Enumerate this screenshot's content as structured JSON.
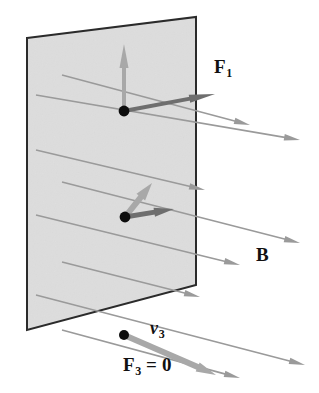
{
  "figure": {
    "type": "physics-vector-diagram",
    "width": 319,
    "height": 393,
    "background_color": "#ffffff"
  },
  "labels": {
    "force_1": {
      "symbol": "F",
      "subscript": "1",
      "text": "F1",
      "x": 214,
      "y": 57
    },
    "field": {
      "symbol": "B",
      "subscript": "",
      "text": "B",
      "x": 256,
      "y": 245
    },
    "velocity_3": {
      "symbol": "v",
      "subscript": "3",
      "text": "v3",
      "x": 150,
      "y": 319
    },
    "force_3": {
      "symbol": "F",
      "subscript": "3",
      "equals": " = 0",
      "text": "F3 = 0",
      "x": 123,
      "y": 355
    }
  },
  "colors": {
    "plane_fill": "#e3e3e3",
    "plane_edge": "#2b2b2b",
    "field_line": "#9a9a9a",
    "force_arrow": "#a8a8a8",
    "velocity_arrow": "#6e6e6e",
    "charge_dot": "#0d0d0d",
    "label_text": "#111111"
  },
  "plane": {
    "name": "magnetic-field-plane",
    "points": "27,38 196,17 196,285 27,330",
    "fill": "#e3e3e3",
    "stroke": "#2b2b2b",
    "stroke_width": 2
  },
  "charges": [
    {
      "id": "charge-1",
      "cx": 124,
      "cy": 111,
      "r": 5.4
    },
    {
      "id": "charge-2",
      "cx": 125,
      "cy": 217,
      "r": 5.4
    },
    {
      "id": "charge-3",
      "cx": 124,
      "cy": 335,
      "r": 5.0
    }
  ],
  "vectors": [
    {
      "id": "force-1-arrow",
      "kind": "force",
      "label": "F1",
      "x1": 124,
      "y1": 111,
      "x2": 124,
      "y2": 44,
      "color": "#a8a8a8",
      "width": 4,
      "head_len": 24,
      "head_w": 9
    },
    {
      "id": "velocity-1-arrow",
      "kind": "velocity",
      "label": "v1",
      "x1": 124,
      "y1": 111,
      "x2": 215,
      "y2": 94,
      "color": "#6e6e6e",
      "width": 4,
      "head_len": 26,
      "head_w": 8
    },
    {
      "id": "force-2-arrow",
      "kind": "force",
      "label": "F2",
      "x1": 125,
      "y1": 217,
      "x2": 152,
      "y2": 183,
      "color": "#a8a8a8",
      "width": 6,
      "head_len": 18,
      "head_w": 11
    },
    {
      "id": "velocity-2-arrow",
      "kind": "velocity",
      "label": "v2",
      "x1": 125,
      "y1": 217,
      "x2": 174,
      "y2": 209,
      "color": "#6e6e6e",
      "width": 5,
      "head_len": 20,
      "head_w": 9
    },
    {
      "id": "velocity-3-arrow",
      "kind": "velocity",
      "label": "v3",
      "x1": 124,
      "y1": 335,
      "x2": 216,
      "y2": 375,
      "color": "#a8a8a8",
      "width": 6,
      "head_len": 20,
      "head_w": 10
    }
  ],
  "field_lines": {
    "name": "magnetic-field-lines",
    "direction": "down-and-to-the-right",
    "color": "#9a9a9a",
    "count": 8,
    "lines": [
      {
        "x1": 36,
        "y1": 95,
        "x2": 300,
        "y2": 140
      },
      {
        "x1": 62,
        "y1": 75,
        "x2": 250,
        "y2": 125
      },
      {
        "x1": 36,
        "y1": 150,
        "x2": 205,
        "y2": 190
      },
      {
        "x1": 62,
        "y1": 182,
        "x2": 300,
        "y2": 243
      },
      {
        "x1": 36,
        "y1": 215,
        "x2": 240,
        "y2": 265
      },
      {
        "x1": 62,
        "y1": 262,
        "x2": 200,
        "y2": 297
      },
      {
        "x1": 36,
        "y1": 295,
        "x2": 305,
        "y2": 365
      },
      {
        "x1": 62,
        "y1": 330,
        "x2": 240,
        "y2": 378
      }
    ]
  }
}
